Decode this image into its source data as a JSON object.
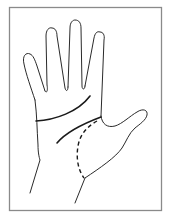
{
  "figure": {
    "elements": [
      {
        "name": "frame",
        "style": "solid",
        "color": "#8a8a8a"
      },
      {
        "name": "hand-outline",
        "style": "solid",
        "color": "#2a2a2a"
      },
      {
        "name": "heart-line",
        "style": "solid-bold",
        "color": "#1a1a1a"
      },
      {
        "name": "head-line",
        "style": "solid-bold",
        "color": "#1a1a1a"
      },
      {
        "name": "life-line",
        "style": "dashed",
        "color": "#1a1a1a"
      }
    ],
    "labels": []
  }
}
